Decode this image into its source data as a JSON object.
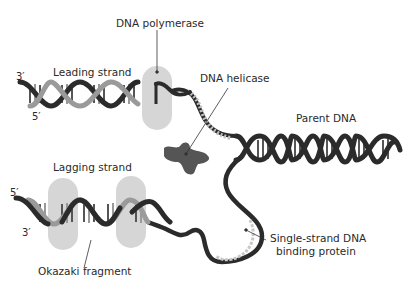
{
  "diagram": {
    "colors": {
      "background": "#ffffff",
      "dark_strand": "#2b2b2b",
      "light_strand": "#9a9a9a",
      "polymerase": "#d6d6d6",
      "helicase": "#555555",
      "ssb": "#c8c8c8",
      "text": "#2a2a2a"
    },
    "labels": {
      "dna_polymerase": "DNA polymerase",
      "leading_strand": "Leading strand",
      "dna_helicase": "DNA helicase",
      "parent_dna": "Parent DNA",
      "lagging_strand": "Lagging strand",
      "okazaki_fragment": "Okazaki fragment",
      "ssb_line1": "Single-strand DNA",
      "ssb_line2": "binding protein"
    },
    "strand_ends": {
      "leading_top": "3′",
      "leading_bottom": "5′",
      "lagging_top": "5′",
      "lagging_bottom": "3′"
    }
  }
}
